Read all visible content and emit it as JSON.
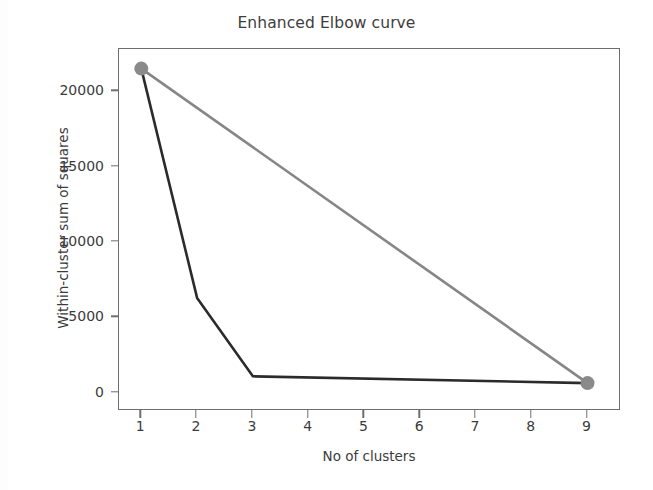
{
  "chart_data": {
    "type": "line",
    "title": "Enhanced Elbow curve",
    "xlabel": "No of clusters",
    "ylabel": "Within-cluster sum  of squares",
    "xlim": [
      0.6,
      9.6
    ],
    "ylim": [
      -1200,
      22800
    ],
    "grid": false,
    "legend": null,
    "xticks": [
      "1",
      "2",
      "3",
      "4",
      "5",
      "6",
      "7",
      "8",
      "9"
    ],
    "xtick_values": [
      1,
      2,
      3,
      4,
      5,
      6,
      7,
      8,
      9
    ],
    "yticks": [
      "0",
      "5000",
      "10000",
      "15000",
      "20000"
    ],
    "ytick_values": [
      0,
      5000,
      10000,
      15000,
      20000
    ],
    "series": [
      {
        "name": "Elbow curve",
        "color": "#2b2b2b",
        "linewidth": 2.6,
        "marker": "none",
        "x": [
          1,
          2,
          3,
          9
        ],
        "values": [
          21500,
          6300,
          1100,
          650
        ]
      },
      {
        "name": "Reference line",
        "color": "#868686",
        "linewidth": 2.6,
        "marker": "circle",
        "marker_color": "#8a8a8a",
        "x": [
          1,
          9
        ],
        "values": [
          21500,
          650
        ]
      }
    ],
    "endpoint_markers": [
      {
        "x": 1,
        "y": 21500
      },
      {
        "x": 9,
        "y": 650
      }
    ]
  },
  "figure": {
    "background": "#ffffff",
    "axis_color": "#6e6e6e",
    "text_color": "#3b3b3b"
  }
}
